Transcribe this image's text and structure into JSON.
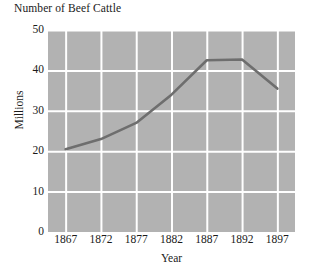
{
  "chart_data": {
    "type": "line",
    "title": "Number of Beef Cattle",
    "xlabel": "Year",
    "ylabel": "Millions",
    "x": [
      1867,
      1872,
      1877,
      1882,
      1887,
      1892,
      1897
    ],
    "values": [
      20.5,
      23.0,
      27.0,
      34.0,
      42.5,
      42.7,
      35.5
    ],
    "series": [
      {
        "name": "Beef cattle",
        "values": [
          20.5,
          23.0,
          27.0,
          34.0,
          42.5,
          42.7,
          35.5
        ]
      }
    ],
    "xtick_labels": [
      "1867",
      "1872",
      "1877",
      "1882",
      "1887",
      "1892",
      "1897"
    ],
    "ytick_labels": [
      "0",
      "10",
      "20",
      "30",
      "40",
      "50"
    ],
    "ytick_values": [
      0,
      10,
      20,
      30,
      40,
      50
    ],
    "xlim": [
      1864.5,
      1899.5
    ],
    "ylim": [
      0,
      50
    ],
    "grid": true,
    "legend": false,
    "colors": {
      "plot_background": "#b2b2b2",
      "gridline": "#ffffff",
      "line": "#6e6e6e",
      "text": "#1a1a1a",
      "page_background": "#ffffff"
    }
  }
}
